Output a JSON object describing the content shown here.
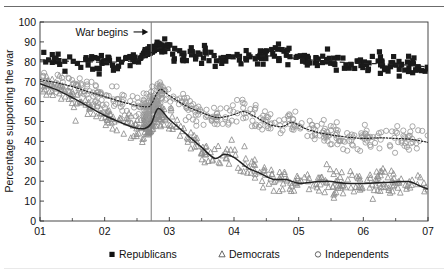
{
  "page": {
    "top_cropped_text": "",
    "background": "#ffffff"
  },
  "chart_data": {
    "type": "scatter",
    "title": "",
    "xlabel": "",
    "ylabel": "Percentage supporting the war",
    "xlim": [
      2001.0,
      2007.0
    ],
    "ylim": [
      0,
      100
    ],
    "xticks": [
      "01",
      "02",
      "03",
      "04",
      "05",
      "06",
      "07"
    ],
    "xtick_values": [
      2001,
      2002,
      2003,
      2004,
      2005,
      2006,
      2007
    ],
    "yticks": [
      0,
      10,
      20,
      30,
      40,
      50,
      60,
      70,
      80,
      90,
      100
    ],
    "grid": false,
    "legend_position": "below-axes",
    "annotations": [
      {
        "text": "War begins",
        "x": 2002.72,
        "arrow": "right",
        "label_x": 2001.55,
        "label_y": 95,
        "vline": true
      }
    ],
    "colors": {
      "republicans": "#1a1a1a",
      "democrats": "#8d8d8d",
      "independents": "#9a9a9a",
      "trend_line": "#2b2b2b",
      "axis": "#333333",
      "vline": "#7a7a7a"
    },
    "series": [
      {
        "name": "Republicans",
        "marker": "filled-square",
        "marker_size": 2.6,
        "color": "#1a1a1a",
        "line_style": "dashed",
        "trend": [
          [
            2001.0,
            81.0
          ],
          [
            2001.25,
            80.6
          ],
          [
            2001.5,
            80.2
          ],
          [
            2001.75,
            80.0
          ],
          [
            2002.0,
            79.8
          ],
          [
            2002.25,
            80.0
          ],
          [
            2002.5,
            81.0
          ],
          [
            2002.72,
            84.5
          ],
          [
            2002.85,
            87.0
          ],
          [
            2003.0,
            86.0
          ],
          [
            2003.25,
            84.5
          ],
          [
            2003.5,
            83.3
          ],
          [
            2003.75,
            82.6
          ],
          [
            2004.0,
            82.2
          ],
          [
            2004.25,
            82.6
          ],
          [
            2004.5,
            83.0
          ],
          [
            2004.75,
            82.4
          ],
          [
            2005.0,
            81.6
          ],
          [
            2005.25,
            80.8
          ],
          [
            2005.5,
            80.2
          ],
          [
            2005.75,
            79.6
          ],
          [
            2006.0,
            79.2
          ],
          [
            2006.25,
            79.0
          ],
          [
            2006.5,
            78.6
          ],
          [
            2006.75,
            78.2
          ],
          [
            2007.0,
            77.4
          ]
        ],
        "scatter_mean_note": "dense cluster 70-95, spike to ~95 at war onset"
      },
      {
        "name": "Independents",
        "marker": "open-circle",
        "marker_size": 2.6,
        "color": "#9a9a9a",
        "line_style": "dotted",
        "trend": [
          [
            2001.0,
            71.0
          ],
          [
            2001.25,
            69.5
          ],
          [
            2001.5,
            67.5
          ],
          [
            2001.75,
            65.0
          ],
          [
            2002.0,
            62.5
          ],
          [
            2002.25,
            60.0
          ],
          [
            2002.5,
            58.0
          ],
          [
            2002.65,
            57.4
          ],
          [
            2002.72,
            58.5
          ],
          [
            2002.85,
            66.0
          ],
          [
            2003.0,
            63.0
          ],
          [
            2003.25,
            58.0
          ],
          [
            2003.5,
            54.5
          ],
          [
            2003.75,
            52.0
          ],
          [
            2004.0,
            53.5
          ],
          [
            2004.15,
            55.0
          ],
          [
            2004.35,
            52.0
          ],
          [
            2004.55,
            48.5
          ],
          [
            2004.75,
            47.5
          ],
          [
            2004.9,
            49.5
          ],
          [
            2005.1,
            46.5
          ],
          [
            2005.3,
            44.5
          ],
          [
            2005.55,
            43.0
          ],
          [
            2005.8,
            42.0
          ],
          [
            2006.0,
            41.5
          ],
          [
            2006.25,
            41.8
          ],
          [
            2006.5,
            41.5
          ],
          [
            2006.75,
            41.0
          ],
          [
            2007.0,
            39.5
          ]
        ],
        "scatter_mean_note": "broad band 30-70 declining"
      },
      {
        "name": "Democrats",
        "marker": "open-triangle",
        "marker_size": 2.8,
        "color": "#8d8d8d",
        "line_style": "solid",
        "trend": [
          [
            2001.0,
            69.0
          ],
          [
            2001.25,
            66.0
          ],
          [
            2001.5,
            62.0
          ],
          [
            2001.75,
            57.5
          ],
          [
            2002.0,
            53.0
          ],
          [
            2002.25,
            49.5
          ],
          [
            2002.45,
            47.0
          ],
          [
            2002.62,
            46.5
          ],
          [
            2002.72,
            49.0
          ],
          [
            2002.83,
            56.5
          ],
          [
            2003.0,
            51.0
          ],
          [
            2003.25,
            44.0
          ],
          [
            2003.5,
            37.0
          ],
          [
            2003.7,
            31.5
          ],
          [
            2003.85,
            33.5
          ],
          [
            2004.0,
            32.0
          ],
          [
            2004.2,
            27.0
          ],
          [
            2004.4,
            24.0
          ],
          [
            2004.6,
            21.0
          ],
          [
            2004.8,
            20.8
          ],
          [
            2005.0,
            19.0
          ],
          [
            2005.2,
            19.5
          ],
          [
            2005.45,
            20.0
          ],
          [
            2005.7,
            19.0
          ],
          [
            2005.95,
            18.8
          ],
          [
            2006.2,
            19.2
          ],
          [
            2006.45,
            19.5
          ],
          [
            2006.7,
            19.8
          ],
          [
            2006.85,
            18.0
          ],
          [
            2007.0,
            16.0
          ]
        ],
        "scatter_mean_note": "band 5-55 steeply declining"
      }
    ]
  },
  "legend": {
    "items": [
      {
        "label": "Republicans",
        "marker": "filled-square"
      },
      {
        "label": "Democrats",
        "marker": "open-triangle"
      },
      {
        "label": "Independents",
        "marker": "open-circle"
      }
    ]
  }
}
